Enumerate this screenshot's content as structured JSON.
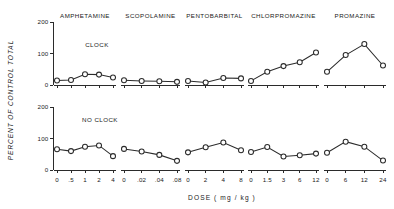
{
  "figure": {
    "y_axis_title": "PERCENT OF CONTROL TOTAL",
    "x_axis_title": "DOSE ( mg / kg )",
    "y_ticks": [
      "0",
      "100",
      "200"
    ],
    "condition_top": "CLOCK",
    "condition_bottom": "NO CLOCK"
  },
  "chart_data": {
    "type": "line",
    "title": "",
    "xlabel": "DOSE ( mg / kg )",
    "ylabel": "PERCENT OF CONTROL TOTAL",
    "ylim": [
      0,
      200
    ],
    "yticks": [
      0,
      100,
      200
    ],
    "grid": false,
    "legend": "none",
    "panel_rows": [
      "CLOCK",
      "NO CLOCK"
    ],
    "panels": [
      {
        "drug": "AMPHETAMINE",
        "dose_labels": [
          "0",
          ".5",
          "1",
          "2",
          "4"
        ],
        "doses": [
          0,
          0.5,
          1,
          2,
          4
        ],
        "clock": [
          14,
          16,
          34,
          33,
          24
        ],
        "no_clock": [
          66,
          60,
          74,
          78,
          44
        ]
      },
      {
        "drug": "SCOPOLAMINE",
        "dose_labels": [
          "0",
          ".02",
          ".04",
          ".08"
        ],
        "doses": [
          0,
          0.02,
          0.04,
          0.08
        ],
        "clock": [
          15,
          13,
          12,
          10
        ],
        "no_clock": [
          67,
          59,
          48,
          29
        ]
      },
      {
        "drug": "PENTOBARBITAL",
        "dose_labels": [
          "0",
          "2",
          "4",
          "8"
        ],
        "doses": [
          0,
          2,
          4,
          8
        ],
        "clock": [
          13,
          8,
          22,
          21
        ],
        "no_clock": [
          56,
          72,
          87,
          63
        ]
      },
      {
        "drug": "CHLORPROMAZINE",
        "dose_labels": [
          "0",
          "1.5",
          "3",
          "6",
          "12"
        ],
        "doses": [
          0,
          1.5,
          3,
          6,
          12
        ],
        "clock": [
          13,
          42,
          60,
          72,
          103
        ],
        "no_clock": [
          57,
          73,
          43,
          47,
          52
        ]
      },
      {
        "drug": "PROMAZINE",
        "dose_labels": [
          "0",
          "6",
          "12",
          "24"
        ],
        "doses": [
          0,
          6,
          12,
          24
        ],
        "clock": [
          42,
          95,
          130,
          62
        ],
        "no_clock": [
          55,
          90,
          74,
          30
        ]
      }
    ]
  }
}
